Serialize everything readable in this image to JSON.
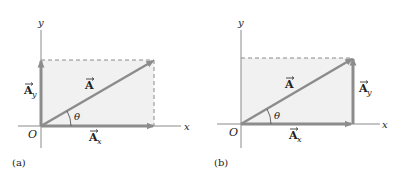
{
  "colors": {
    "fill": "#f1f1f1",
    "vector": "#8c8c8c",
    "axis": "#8a8a8a",
    "dash": "#8a8a8a",
    "text": "#222222"
  },
  "panels": [
    {
      "id": "a",
      "caption": "(a)",
      "x_axis_label": "x",
      "y_axis_label": "y",
      "origin_label": "O",
      "angle_label": "θ",
      "vector_label": "A",
      "x_component_label": "A",
      "x_component_sub": "x",
      "y_component_label": "A",
      "y_component_sub": "y",
      "y_component_position": "left"
    },
    {
      "id": "b",
      "caption": "(b)",
      "x_axis_label": "x",
      "y_axis_label": "y",
      "origin_label": "O",
      "angle_label": "θ",
      "vector_label": "A",
      "x_component_label": "A",
      "x_component_sub": "x",
      "y_component_label": "A",
      "y_component_sub": "y",
      "y_component_position": "right"
    }
  ]
}
